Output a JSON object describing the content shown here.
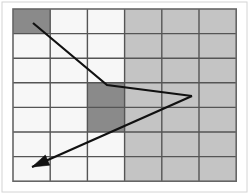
{
  "figure": {
    "width": 249,
    "height": 194,
    "background_color": "#ffffff"
  },
  "colors": {
    "background": "#ffffff",
    "cell_light": "#f7f7f7",
    "cell_medium": "#c4c4c4",
    "cell_dark": "#8a8a8a",
    "gridline": "#555555",
    "border": "#666666",
    "arrow": "#111111",
    "outer_frame": "#d4d4d4"
  },
  "grid": {
    "columns": 6,
    "rows": 7,
    "origin_x": 13,
    "origin_y": 9,
    "cell_width": 37.2,
    "cell_height": 24.6,
    "line_width": 1.4,
    "border_width": 1.6,
    "column_labels": [
      "1",
      "2",
      "3",
      "4",
      "5",
      "6"
    ],
    "row_labels": [
      "1",
      "2",
      "3",
      "4",
      "5",
      "6",
      "7"
    ],
    "default_fill_by_column": [
      "cell_light",
      "cell_light",
      "cell_light",
      "cell_medium",
      "cell_medium",
      "cell_medium"
    ],
    "highlighted_cells": [
      {
        "name": "start-cell",
        "col": 1,
        "row": 1,
        "fill": "cell_dark"
      },
      {
        "name": "goal-cell-upper",
        "col": 3,
        "row": 4,
        "fill": "cell_dark"
      },
      {
        "name": "goal-cell-lower",
        "col": 3,
        "row": 5,
        "fill": "cell_dark"
      }
    ]
  },
  "arrows": [
    {
      "name": "arrow-incoming",
      "points": [
        [
          33,
          23
        ],
        [
          107,
          85
        ],
        [
          192,
          96
        ]
      ],
      "head_at_start": false,
      "head_at_end": false,
      "stroke_width": 2.2
    },
    {
      "name": "arrow-outgoing",
      "points": [
        [
          192,
          96
        ],
        [
          32,
          167
        ]
      ],
      "head_at_start": false,
      "head_at_end": true,
      "stroke_width": 2.2,
      "head_length": 17,
      "head_half_width": 5.5
    }
  ],
  "outer_frame": {
    "x": 2,
    "y": 2,
    "width": 245,
    "height": 190,
    "visible": true
  }
}
